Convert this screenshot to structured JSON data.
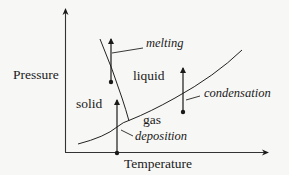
{
  "diagram": {
    "type": "phase-diagram",
    "axes": {
      "x_label": "Temperature",
      "y_label": "Pressure"
    },
    "regions": {
      "solid": "solid",
      "liquid": "liquid",
      "gas": "gas"
    },
    "transitions": {
      "melting": "melting",
      "condensation": "condensation",
      "deposition": "deposition"
    },
    "colors": {
      "background": "#f7f7f5",
      "ink": "#1a1a1a"
    }
  }
}
